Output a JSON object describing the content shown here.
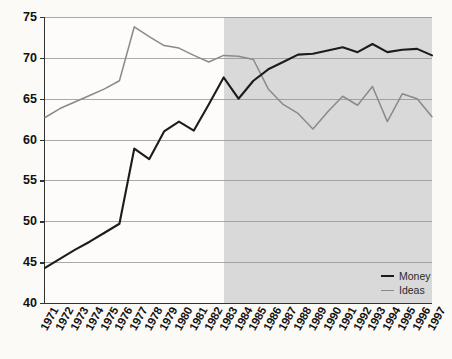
{
  "chart_data": {
    "type": "line",
    "title": "",
    "subtitle": "",
    "xlabel": "",
    "ylabel": "",
    "x": [
      1971,
      1972,
      1973,
      1974,
      1975,
      1976,
      1977,
      1978,
      1979,
      1980,
      1981,
      1982,
      1983,
      1984,
      1985,
      1986,
      1987,
      1988,
      1989,
      1990,
      1991,
      1992,
      1993,
      1994,
      1995,
      1996,
      1997
    ],
    "xtick_labels": [
      "1971",
      "1972",
      "1973",
      "1974",
      "1975",
      "1976",
      "1977",
      "1978",
      "1979",
      "1980",
      "1981",
      "1982",
      "1983",
      "1984",
      "1985",
      "1986",
      "1987",
      "1988",
      "1989",
      "1990",
      "1991",
      "1992",
      "1993",
      "1994",
      "1995",
      "1996",
      "1997"
    ],
    "ylim": [
      40,
      75
    ],
    "ytick_labels": [
      "40",
      "45",
      "50",
      "55",
      "60",
      "65",
      "70",
      "75"
    ],
    "yticks": [
      40,
      45,
      50,
      55,
      60,
      65,
      70,
      75
    ],
    "grid": "horizontal",
    "legend_position": "inside-bottom-right",
    "series": [
      {
        "name": "Money",
        "color": "#1c1c1c",
        "values": [
          44.3,
          45.4,
          46.5,
          47.5,
          48.6,
          49.7,
          58.9,
          57.6,
          61.0,
          62.2,
          61.1,
          64.3,
          67.6,
          65.0,
          67.2,
          68.6,
          69.5,
          70.4,
          70.5,
          70.9,
          71.3,
          70.7,
          71.7,
          70.7,
          71.0,
          71.1,
          70.3
        ]
      },
      {
        "name": "Ideas",
        "color": "#8a8a8a",
        "values": [
          62.7,
          63.8,
          64.6,
          65.4,
          66.2,
          67.2,
          73.8,
          72.6,
          71.5,
          71.2,
          70.3,
          69.5,
          70.3,
          70.2,
          69.8,
          66.2,
          64.3,
          63.2,
          61.3,
          63.4,
          65.3,
          64.2,
          66.5,
          62.2,
          65.6,
          65.0,
          62.8
        ]
      }
    ],
    "shaded_region": {
      "start": 1983,
      "end": 1997,
      "color": "#d2d2d2"
    }
  }
}
